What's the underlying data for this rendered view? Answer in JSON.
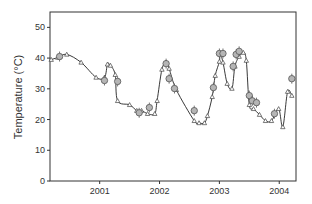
{
  "chart_data": {
    "type": "line",
    "title": "",
    "xlabel": "",
    "ylabel": "Temperature (°C)",
    "xlim": [
      2000.17,
      2004.28
    ],
    "ylim": [
      0,
      55
    ],
    "xticks": [
      2001,
      2002,
      2003,
      2004
    ],
    "xtick_labels": [
      "2001",
      "2002",
      "2003",
      "2004"
    ],
    "yticks": [
      0,
      10,
      20,
      30,
      40,
      50
    ],
    "ytick_labels": [
      "0",
      "10",
      "20",
      "30",
      "40",
      "50"
    ],
    "grid": false,
    "legend": null,
    "series": [
      {
        "name": "modeled (line with triangles)",
        "marker": "triangle",
        "x": [
          2000.19,
          2000.3,
          2000.45,
          2000.69,
          2000.94,
          2001.08,
          2001.13,
          2001.18,
          2001.26,
          2001.3,
          2001.5,
          2001.62,
          2001.7,
          2001.8,
          2001.92,
          2001.96,
          2002.04,
          2002.11,
          2002.16,
          2002.28,
          2002.58,
          2002.66,
          2002.75,
          2002.8,
          2002.88,
          2002.93,
          2003.0,
          2003.01,
          2003.06,
          2003.13,
          2003.21,
          2003.26,
          2003.33,
          2003.4,
          2003.45,
          2003.5,
          2003.57,
          2003.67,
          2003.77,
          2003.87,
          2003.99,
          2004.06,
          2004.14,
          2004.21
        ],
        "y": [
          39.5,
          40.2,
          41.2,
          38.6,
          33.7,
          33.7,
          38,
          37.6,
          34.6,
          26.1,
          24.8,
          22.9,
          22.9,
          21.9,
          21.9,
          26.1,
          36.3,
          38.6,
          36.6,
          29.7,
          19.6,
          18.9,
          18.9,
          21.2,
          27.4,
          34.3,
          38.9,
          41.5,
          38.6,
          31.7,
          30.1,
          37.3,
          40.5,
          41.8,
          39.2,
          24.8,
          23.5,
          21.6,
          19.6,
          19.6,
          23.5,
          17.6,
          29.1,
          27.8
        ]
      },
      {
        "name": "observed (grey circles)",
        "marker": "circle",
        "x": [
          2000.33,
          2001.08,
          2001.3,
          2001.66,
          2001.83,
          2002.11,
          2002.16,
          2002.25,
          2002.58,
          2002.9,
          2003.0,
          2003.06,
          2003.23,
          2003.28,
          2003.33,
          2003.5,
          2003.55,
          2003.62,
          2003.92,
          2004.21
        ],
        "y": [
          40.5,
          32.7,
          32.4,
          22.2,
          23.9,
          38.2,
          33.3,
          30.1,
          22.9,
          30.4,
          41.5,
          41.5,
          37.3,
          41.2,
          42.2,
          27.8,
          26.1,
          25.5,
          21.9,
          33.3
        ]
      }
    ]
  }
}
